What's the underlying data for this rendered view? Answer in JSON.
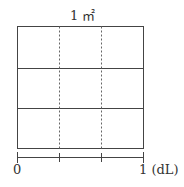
{
  "diagram": {
    "title": "1 ㎡",
    "grid": {
      "rows": 3,
      "cols": 3,
      "vertical_lines": "dashed",
      "horizontal_lines": "solid"
    },
    "scale": {
      "start_label": "0",
      "end_label": "1 (dL)",
      "ticks": 4
    }
  }
}
